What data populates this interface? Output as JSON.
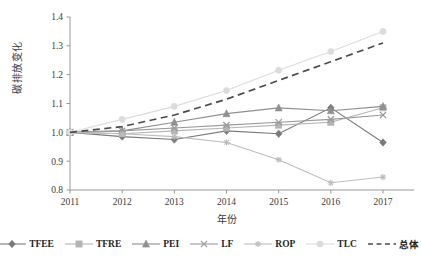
{
  "chart_data": {
    "type": "line",
    "title": "",
    "xlabel": "年份",
    "ylabel": "碳排放变化",
    "x": [
      2011,
      2012,
      2013,
      2014,
      2015,
      2016,
      2017
    ],
    "xticklabels": [
      "2011",
      "2012",
      "2013",
      "2014",
      "2015",
      "2016",
      "2017"
    ],
    "yticklabels": [
      "0.8",
      "0.9",
      "1.0",
      "1.1",
      "1.2",
      "1.3",
      "1.4"
    ],
    "yticks": [
      0.8,
      0.9,
      1.0,
      1.1,
      1.2,
      1.3,
      1.4
    ],
    "ylim": [
      0.8,
      1.4
    ],
    "xlim": [
      2011,
      2017
    ],
    "grid": false,
    "legend_position": "bottom",
    "series": [
      {
        "name": "TFEE",
        "marker": "diamond",
        "color": "#7a7a7a",
        "dashed": false,
        "values": [
          1.0,
          0.985,
          0.975,
          1.005,
          0.995,
          1.085,
          0.965
        ]
      },
      {
        "name": "TFRE",
        "marker": "square",
        "color": "#b5b5b5",
        "dashed": false,
        "values": [
          1.0,
          0.995,
          1.005,
          1.015,
          1.025,
          1.035,
          1.085
        ]
      },
      {
        "name": "PEI",
        "marker": "triangle",
        "color": "#8f8f8f",
        "dashed": false,
        "values": [
          1.0,
          1.005,
          1.035,
          1.065,
          1.085,
          1.075,
          1.09
        ]
      },
      {
        "name": "LF",
        "marker": "x",
        "color": "#9a9a9a",
        "dashed": false,
        "values": [
          1.0,
          1.005,
          1.015,
          1.025,
          1.035,
          1.045,
          1.06
        ]
      },
      {
        "name": "ROP",
        "marker": "asterisk",
        "color": "#bdbdbd",
        "dashed": false,
        "values": [
          1.0,
          0.995,
          0.985,
          0.965,
          0.905,
          0.825,
          0.845
        ]
      },
      {
        "name": "TLC",
        "marker": "circle",
        "color": "#dcdcdc",
        "dashed": false,
        "values": [
          1.0,
          1.045,
          1.09,
          1.145,
          1.215,
          1.28,
          1.35
        ]
      },
      {
        "name": "总体",
        "marker": "none",
        "color": "#4a4a4a",
        "dashed": true,
        "values": [
          1.0,
          1.02,
          1.06,
          1.115,
          1.18,
          1.245,
          1.31
        ]
      }
    ]
  },
  "legend": {
    "items": [
      {
        "label": "TFEE",
        "marker": "diamond",
        "color": "#7a7a7a",
        "dashed": false
      },
      {
        "label": "TFRE",
        "marker": "square",
        "color": "#b5b5b5",
        "dashed": false
      },
      {
        "label": "PEI",
        "marker": "triangle",
        "color": "#8f8f8f",
        "dashed": false
      },
      {
        "label": "LF",
        "marker": "x",
        "color": "#9a9a9a",
        "dashed": false
      },
      {
        "label": "ROP",
        "marker": "asterisk",
        "color": "#bdbdbd",
        "dashed": false
      },
      {
        "label": "TLC",
        "marker": "circle",
        "color": "#dcdcdc",
        "dashed": false
      },
      {
        "label": "总体",
        "marker": "none",
        "color": "#4a4a4a",
        "dashed": true
      }
    ]
  },
  "axis": {
    "line_color": "#8c8c8c",
    "text_color": "#3a3a3a"
  }
}
